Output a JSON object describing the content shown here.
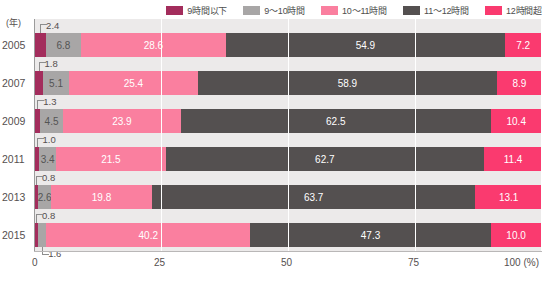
{
  "chart_data": {
    "type": "bar",
    "orientation": "horizontal",
    "stacked": true,
    "title": "",
    "xlabel": "100 (%)",
    "ylabel": "(年)",
    "xlim": [
      0,
      100
    ],
    "xticks": [
      "0",
      "25",
      "50",
      "75",
      "100"
    ],
    "xtick_suffix": "(%)",
    "grid": true,
    "legend_position": "top-right",
    "categories": [
      "2005",
      "2007",
      "2009",
      "2011",
      "2013",
      "2015"
    ],
    "series": [
      {
        "name": "9時間以下",
        "color": "#a32d5c",
        "values": [
          2.4,
          1.8,
          1.3,
          1.0,
          0.8,
          0.8
        ]
      },
      {
        "name": "9～10時間",
        "color": "#a8a6a6",
        "values": [
          6.8,
          5.1,
          4.5,
          3.4,
          2.6,
          1.6
        ]
      },
      {
        "name": "10～11時間",
        "color": "#fa7f9f",
        "values": [
          28.6,
          25.4,
          23.9,
          21.5,
          19.8,
          40.2
        ]
      },
      {
        "name": "11～12時間",
        "color": "#545050",
        "values": [
          54.9,
          58.9,
          62.5,
          62.7,
          63.7,
          47.3
        ]
      },
      {
        "name": "12時間超",
        "color": "#fa3a6f",
        "values": [
          7.2,
          8.9,
          10.4,
          11.4,
          13.1,
          10.0
        ]
      }
    ],
    "rows": [
      {
        "year": "2005",
        "segments": [
          {
            "series": "9時間以下",
            "value": 2.4,
            "label": "",
            "callout": "2.4",
            "callout_pos": "top"
          },
          {
            "series": "9～10時間",
            "value": 6.8,
            "label": "6.8"
          },
          {
            "series": "10～11時間",
            "value": 28.6,
            "label": "28.6"
          },
          {
            "series": "11～12時間",
            "value": 54.9,
            "label": "54.9"
          },
          {
            "series": "12時間超",
            "value": 7.2,
            "label": "7.2"
          }
        ]
      },
      {
        "year": "2007",
        "segments": [
          {
            "series": "9時間以下",
            "value": 1.8,
            "label": "",
            "callout": "1.8",
            "callout_pos": "top"
          },
          {
            "series": "9～10時間",
            "value": 5.1,
            "label": "5.1"
          },
          {
            "series": "10～11時間",
            "value": 25.4,
            "label": "25.4"
          },
          {
            "series": "11～12時間",
            "value": 58.9,
            "label": "58.9"
          },
          {
            "series": "12時間超",
            "value": 8.9,
            "label": "8.9"
          }
        ]
      },
      {
        "year": "2009",
        "segments": [
          {
            "series": "9時間以下",
            "value": 1.3,
            "label": "",
            "callout": "1.3",
            "callout_pos": "top"
          },
          {
            "series": "9～10時間",
            "value": 4.5,
            "label": "4.5"
          },
          {
            "series": "10～11時間",
            "value": 23.9,
            "label": "23.9"
          },
          {
            "series": "11～12時間",
            "value": 62.5,
            "label": "62.5"
          },
          {
            "series": "12時間超",
            "value": 10.4,
            "label": "10.4"
          }
        ]
      },
      {
        "year": "2011",
        "segments": [
          {
            "series": "9時間以下",
            "value": 1.0,
            "label": "",
            "callout": "1.0",
            "callout_pos": "top"
          },
          {
            "series": "9～10時間",
            "value": 3.4,
            "label": "3.4"
          },
          {
            "series": "10～11時間",
            "value": 21.5,
            "label": "21.5"
          },
          {
            "series": "11～12時間",
            "value": 62.7,
            "label": "62.7"
          },
          {
            "series": "12時間超",
            "value": 11.4,
            "label": "11.4"
          }
        ]
      },
      {
        "year": "2013",
        "segments": [
          {
            "series": "9時間以下",
            "value": 0.8,
            "label": "",
            "callout": "0.8",
            "callout_pos": "top"
          },
          {
            "series": "9～10時間",
            "value": 2.6,
            "label": "2.6"
          },
          {
            "series": "10～11時間",
            "value": 19.8,
            "label": "19.8"
          },
          {
            "series": "11～12時間",
            "value": 63.7,
            "label": "63.7"
          },
          {
            "series": "12時間超",
            "value": 13.1,
            "label": "13.1"
          }
        ]
      },
      {
        "year": "2015",
        "segments": [
          {
            "series": "9時間以下",
            "value": 0.8,
            "label": "",
            "callout": "0.8",
            "callout_pos": "top"
          },
          {
            "series": "9～10時間",
            "value": 1.6,
            "label": "",
            "callout": "1.6",
            "callout_pos": "bottom"
          },
          {
            "series": "10～11時間",
            "value": 40.2,
            "label": "40.2"
          },
          {
            "series": "11～12時間",
            "value": 47.3,
            "label": "47.3"
          },
          {
            "series": "12時間超",
            "value": 10.0,
            "label": "10.0"
          }
        ]
      }
    ]
  }
}
